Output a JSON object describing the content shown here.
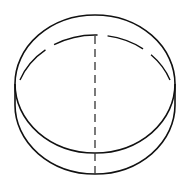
{
  "diagram": {
    "stroke_color": "#111111",
    "background_color": "#ffffff",
    "stroke_width": 1.6,
    "dash_pattern": "8 5",
    "top_face": {
      "cx": 95,
      "cy": 84,
      "rx": 80,
      "ry": 69
    },
    "bottom_face": {
      "cx": 95,
      "cy": 105,
      "rx": 80,
      "ry": 69
    },
    "axis": {
      "x": 95,
      "y1": 36,
      "y2": 174
    }
  }
}
